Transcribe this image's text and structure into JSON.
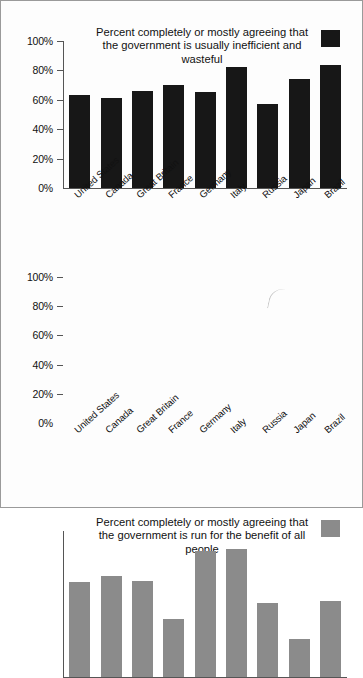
{
  "figure": {
    "background": "#fdfdfd",
    "border_color": "#9a9a9a"
  },
  "chart_data": [
    {
      "type": "bar",
      "id": "inefficient-wasteful",
      "title": "Percent completely or mostly agreeing that the government is usually inefficient and wasteful",
      "legend_label": "Percent completely or mostly agreeing that the government is usually inefficient and wasteful",
      "legend_position": "top-center",
      "series_color": "#171717",
      "xlabel": "",
      "ylabel": "",
      "ylim": [
        0,
        100
      ],
      "ytick_labels": [
        "100%",
        "80%",
        "60%",
        "40%",
        "20%",
        "0%"
      ],
      "ytick_values": [
        100,
        80,
        60,
        40,
        20,
        0
      ],
      "grid": false,
      "categories": [
        "United States",
        "Canada",
        "Great Britain",
        "France",
        "Germany",
        "Italy",
        "Russia",
        "Japan",
        "Brazil"
      ],
      "values": [
        63,
        61,
        66,
        70,
        65,
        82,
        57,
        74,
        84
      ]
    },
    {
      "type": "bar",
      "id": "run-for-benefit-of-all",
      "title": "Percent completely or mostly agreeing that the government is run for the benefit of all people",
      "legend_label": "Percent completely or mostly agreeing that the government is run for the benefit of all people",
      "legend_position": "top-center",
      "series_color": "#8b8b8b",
      "xlabel": "",
      "ylabel": "",
      "ylim": [
        0,
        100
      ],
      "ytick_labels": [
        "100%",
        "80%",
        "60%",
        "40%",
        "20%",
        "0%"
      ],
      "ytick_values": [
        100,
        80,
        60,
        40,
        20,
        0
      ],
      "grid": false,
      "categories": [
        "United States",
        "Canada",
        "Great Britain",
        "France",
        "Germany",
        "Italy",
        "Russia",
        "Japan",
        "Brazil"
      ],
      "values": [
        65,
        69,
        66,
        40,
        86,
        88,
        51,
        26,
        52
      ]
    }
  ]
}
